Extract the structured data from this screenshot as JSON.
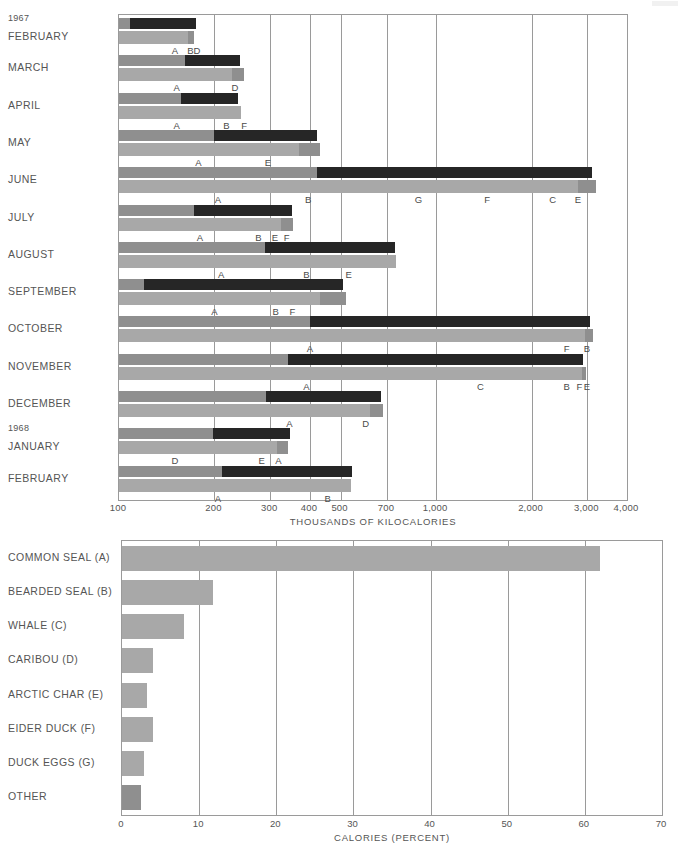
{
  "chart_data": [
    {
      "type": "bar",
      "id": "monthly-energy",
      "title": "",
      "xlabel": "THOUSANDS OF KILOCALORIES",
      "ylabel": "",
      "scale": "log",
      "xlim": [
        100,
        4000
      ],
      "grid": true,
      "legend": "none",
      "tick_labels": [
        "100",
        "200",
        "300",
        "400",
        "500",
        "700",
        "1,000",
        "2,000",
        "3,000",
        "4,000"
      ],
      "tick_values": [
        100,
        200,
        300,
        400,
        500,
        700,
        1000,
        2000,
        3000,
        4000
      ],
      "year_markers": [
        {
          "label": "1967",
          "row": "FEBRUARY"
        },
        {
          "label": "1968",
          "row": "JANUARY"
        }
      ],
      "categories": [
        "FEBRUARY",
        "MARCH",
        "APRIL",
        "MAY",
        "JUNE",
        "JULY",
        "AUGUST",
        "SEPTEMBER",
        "OCTOBER",
        "NOVEMBER",
        "DECEMBER",
        "JANUARY",
        "FEBRUARY"
      ],
      "series": [
        {
          "name": "Total energy (dark bar)",
          "color": "#262626",
          "values": [
            175,
            240,
            238,
            420,
            3100,
            350,
            740,
            510,
            3050,
            2900,
            670,
            345,
            545
          ]
        },
        {
          "name": "Cumulative by food source (light bar)",
          "color": "#a8a8a8",
          "values": [
            172,
            248,
            243,
            430,
            3200,
            355,
            745,
            520,
            3120,
            2980,
            680,
            340,
            538
          ]
        }
      ],
      "stacked_breakdown": [
        {
          "month": "FEBRUARY",
          "labels": [
            "A",
            "B",
            "D"
          ],
          "label_values": [
            150,
            168,
            175
          ]
        },
        {
          "month": "MARCH",
          "labels": [
            "A",
            "D"
          ],
          "label_values": [
            152,
            230
          ]
        },
        {
          "month": "APRIL",
          "labels": [
            "A",
            "B",
            "F"
          ],
          "label_values": [
            152,
            215,
            240
          ]
        },
        {
          "month": "MAY",
          "labels": [
            "A",
            "E"
          ],
          "label_values": [
            178,
            290
          ]
        },
        {
          "month": "JUNE",
          "labels": [
            "A",
            "B",
            "G",
            "F",
            "C",
            "E"
          ],
          "label_values": [
            205,
            390,
            880,
            1450,
            2350,
            2800
          ]
        },
        {
          "month": "JULY",
          "labels": [
            "A",
            "B",
            "E",
            "F"
          ],
          "label_values": [
            180,
            272,
            305,
            332
          ]
        },
        {
          "month": "AUGUST",
          "labels": [
            "A",
            "B",
            "E"
          ],
          "label_values": [
            210,
            385,
            520
          ]
        },
        {
          "month": "SEPTEMBER",
          "labels": [
            "A",
            "B",
            "F"
          ],
          "label_values": [
            200,
            308,
            345
          ]
        },
        {
          "month": "OCTOBER",
          "labels": [
            "A",
            "F",
            "B"
          ],
          "label_values": [
            400,
            2580,
            2980
          ]
        },
        {
          "month": "NOVEMBER",
          "labels": [
            "A",
            "C",
            "B",
            "F",
            "E"
          ],
          "label_values": [
            390,
            1380,
            2560,
            2830,
            2950
          ]
        },
        {
          "month": "DECEMBER",
          "labels": [
            "A",
            "D"
          ],
          "label_values": [
            345,
            585
          ]
        },
        {
          "month": "JANUARY",
          "labels": [
            "D",
            "E",
            "A"
          ],
          "label_values": [
            198,
            290,
            325
          ]
        },
        {
          "month": "FEBRUARY",
          "labels": [
            "A",
            "B"
          ],
          "label_values": [
            205,
            455
          ]
        }
      ]
    },
    {
      "type": "bar",
      "id": "calories-by-source",
      "orientation": "horizontal",
      "title": "",
      "xlabel": "CALORIES  (PERCENT)",
      "ylabel": "",
      "scale": "linear",
      "xlim": [
        0,
        70
      ],
      "grid": true,
      "legend": "none",
      "tick_labels": [
        "0",
        "10",
        "20",
        "30",
        "40",
        "50",
        "60",
        "70"
      ],
      "tick_values": [
        0,
        10,
        20,
        30,
        40,
        50,
        60,
        70
      ],
      "categories": [
        "COMMON SEAL (A)",
        "BEARDED SEAL (B)",
        "WHALE (C)",
        "CARIBOU (D)",
        "ARCTIC CHAR (E)",
        "EIDER DUCK (F)",
        "DUCK EGGS (G)",
        "OTHER"
      ],
      "values": [
        62.0,
        11.8,
        8.0,
        4.0,
        3.3,
        4.0,
        2.9,
        2.4
      ],
      "bar_colors": [
        "#a8a8a8",
        "#a8a8a8",
        "#a8a8a8",
        "#a8a8a8",
        "#a8a8a8",
        "#a8a8a8",
        "#a8a8a8",
        "#8f8f8f"
      ]
    }
  ],
  "top_chart": {
    "axis_title": "THOUSANDS OF KILOCALORIES",
    "ticks": [
      {
        "label": "100",
        "value": 100
      },
      {
        "label": "200",
        "value": 200
      },
      {
        "label": "300",
        "value": 300
      },
      {
        "label": "400",
        "value": 400
      },
      {
        "label": "500",
        "value": 500
      },
      {
        "label": "700",
        "value": 700
      },
      {
        "label": "1,000",
        "value": 1000
      },
      {
        "label": "2,000",
        "value": 2000
      },
      {
        "label": "3,000",
        "value": 3000
      },
      {
        "label": "4,000",
        "value": 4000
      }
    ],
    "rows": [
      {
        "year": "1967",
        "month": "FEBRUARY",
        "dark": {
          "lead": 108,
          "start": 100,
          "end": 175
        },
        "light": [
          {
            "from": 100,
            "to": 165,
            "c": "#a8a8a8"
          },
          {
            "from": 165,
            "to": 172,
            "c": "#8f8f8f"
          }
        ],
        "labels": [
          {
            "t": "A",
            "v": 150
          },
          {
            "t": "B",
            "v": 168
          },
          {
            "t": "D",
            "v": 176
          }
        ]
      },
      {
        "year": "",
        "month": "MARCH",
        "dark": {
          "lead": 162,
          "start": 100,
          "end": 240
        },
        "light": [
          {
            "from": 100,
            "to": 228,
            "c": "#a8a8a8"
          },
          {
            "from": 228,
            "to": 248,
            "c": "#8f8f8f"
          }
        ],
        "labels": [
          {
            "t": "A",
            "v": 152
          },
          {
            "t": "D",
            "v": 232
          }
        ]
      },
      {
        "year": "",
        "month": "APRIL",
        "dark": {
          "lead": 157,
          "start": 100,
          "end": 238
        },
        "light": [
          {
            "from": 100,
            "to": 243,
            "c": "#a8a8a8"
          }
        ],
        "labels": [
          {
            "t": "A",
            "v": 152
          },
          {
            "t": "B",
            "v": 218
          },
          {
            "t": "F",
            "v": 248
          }
        ]
      },
      {
        "year": "",
        "month": "MAY",
        "dark": {
          "lead": 200,
          "start": 100,
          "end": 420
        },
        "light": [
          {
            "from": 100,
            "to": 370,
            "c": "#a8a8a8"
          },
          {
            "from": 370,
            "to": 430,
            "c": "#8f8f8f"
          }
        ],
        "labels": [
          {
            "t": "A",
            "v": 178
          },
          {
            "t": "E",
            "v": 295
          }
        ]
      },
      {
        "year": "",
        "month": "JUNE",
        "dark": {
          "lead": 420,
          "start": 100,
          "end": 3100
        },
        "light": [
          {
            "from": 100,
            "to": 2800,
            "c": "#a8a8a8"
          },
          {
            "from": 2800,
            "to": 3200,
            "c": "#8f8f8f"
          }
        ],
        "labels": [
          {
            "t": "A",
            "v": 205
          },
          {
            "t": "B",
            "v": 395
          },
          {
            "t": "G",
            "v": 880
          },
          {
            "t": "F",
            "v": 1450
          },
          {
            "t": "C",
            "v": 2330
          },
          {
            "t": "E",
            "v": 2800
          }
        ]
      },
      {
        "year": "",
        "month": "JULY",
        "dark": {
          "lead": 173,
          "start": 100,
          "end": 350
        },
        "light": [
          {
            "from": 100,
            "to": 325,
            "c": "#a8a8a8"
          },
          {
            "from": 325,
            "to": 355,
            "c": "#8f8f8f"
          }
        ],
        "labels": [
          {
            "t": "A",
            "v": 180
          },
          {
            "t": "B",
            "v": 275
          },
          {
            "t": "E",
            "v": 310
          },
          {
            "t": "F",
            "v": 338
          }
        ]
      },
      {
        "year": "",
        "month": "AUGUST",
        "dark": {
          "lead": 288,
          "start": 100,
          "end": 740
        },
        "light": [
          {
            "from": 100,
            "to": 745,
            "c": "#a8a8a8"
          }
        ],
        "labels": [
          {
            "t": "A",
            "v": 210
          },
          {
            "t": "B",
            "v": 390
          },
          {
            "t": "E",
            "v": 530
          }
        ]
      },
      {
        "year": "",
        "month": "SEPTEMBER",
        "dark": {
          "lead": 120,
          "start": 100,
          "end": 510
        },
        "light": [
          {
            "from": 100,
            "to": 430,
            "c": "#a8a8a8"
          },
          {
            "from": 430,
            "to": 520,
            "c": "#8f8f8f"
          }
        ],
        "labels": [
          {
            "t": "A",
            "v": 200
          },
          {
            "t": "B",
            "v": 312
          },
          {
            "t": "F",
            "v": 352
          }
        ]
      },
      {
        "year": "",
        "month": "OCTOBER",
        "dark": {
          "lead": 400,
          "start": 100,
          "end": 3050
        },
        "light": [
          {
            "from": 100,
            "to": 2950,
            "c": "#a8a8a8"
          },
          {
            "from": 2950,
            "to": 3120,
            "c": "#8f8f8f"
          }
        ],
        "labels": [
          {
            "t": "A",
            "v": 400
          },
          {
            "t": "F",
            "v": 2580
          },
          {
            "t": "B",
            "v": 2990
          }
        ]
      },
      {
        "year": "",
        "month": "NOVEMBER",
        "dark": {
          "lead": 340,
          "start": 100,
          "end": 2900
        },
        "light": [
          {
            "from": 100,
            "to": 2880,
            "c": "#a8a8a8"
          },
          {
            "from": 2880,
            "to": 2980,
            "c": "#8f8f8f"
          }
        ],
        "labels": [
          {
            "t": "A",
            "v": 390
          },
          {
            "t": "C",
            "v": 1380
          },
          {
            "t": "B",
            "v": 2580
          },
          {
            "t": "F",
            "v": 2830
          },
          {
            "t": "E",
            "v": 2990
          }
        ]
      },
      {
        "year": "",
        "month": "DECEMBER",
        "dark": {
          "lead": 290,
          "start": 100,
          "end": 670
        },
        "light": [
          {
            "from": 100,
            "to": 620,
            "c": "#a8a8a8"
          },
          {
            "from": 620,
            "to": 680,
            "c": "#8f8f8f"
          }
        ],
        "labels": [
          {
            "t": "A",
            "v": 345
          },
          {
            "t": "D",
            "v": 600
          }
        ]
      },
      {
        "year": "1968",
        "month": "JANUARY",
        "dark": {
          "lead": 198,
          "start": 100,
          "end": 345
        },
        "light": [
          {
            "from": 100,
            "to": 315,
            "c": "#a8a8a8"
          },
          {
            "from": 315,
            "to": 340,
            "c": "#8f8f8f"
          }
        ],
        "labels": [
          {
            "t": "D",
            "v": 150
          },
          {
            "t": "E",
            "v": 282
          },
          {
            "t": "A",
            "v": 318
          }
        ]
      },
      {
        "year": "",
        "month": "FEBRUARY",
        "dark": {
          "lead": 212,
          "start": 100,
          "end": 545
        },
        "light": [
          {
            "from": 100,
            "to": 538,
            "c": "#a8a8a8"
          }
        ],
        "labels": [
          {
            "t": "A",
            "v": 205
          },
          {
            "t": "B",
            "v": 455
          }
        ]
      }
    ]
  },
  "bottom_chart": {
    "axis_title": "CALORIES  (PERCENT)",
    "ticks": [
      "0",
      "10",
      "20",
      "30",
      "40",
      "50",
      "60",
      "70"
    ],
    "rows": [
      {
        "label": "COMMON SEAL (A)",
        "value": 62.0,
        "color": "#a8a8a8"
      },
      {
        "label": "BEARDED SEAL (B)",
        "value": 11.8,
        "color": "#a8a8a8"
      },
      {
        "label": "WHALE (C)",
        "value": 8.0,
        "color": "#a8a8a8"
      },
      {
        "label": "CARIBOU (D)",
        "value": 4.0,
        "color": "#a8a8a8"
      },
      {
        "label": "ARCTIC CHAR (E)",
        "value": 3.3,
        "color": "#a8a8a8"
      },
      {
        "label": "EIDER DUCK (F)",
        "value": 4.0,
        "color": "#a8a8a8"
      },
      {
        "label": "DUCK EGGS (G)",
        "value": 2.9,
        "color": "#a8a8a8"
      },
      {
        "label": "OTHER",
        "value": 2.4,
        "color": "#8f8f8f"
      }
    ]
  },
  "colors": {
    "bar_dark": "#262626",
    "bar_light": "#a8a8a8",
    "bar_mid": "#8f8f8f",
    "grid": "#9a9a9a",
    "text": "#555555",
    "background": "#ffffff"
  }
}
